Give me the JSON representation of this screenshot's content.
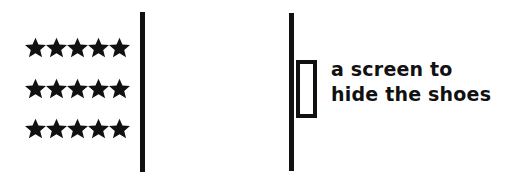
{
  "figure": {
    "background_color": "#ffffff",
    "ink_color": "#111111",
    "left_panel": {
      "name": "shoes-star-grid",
      "icon": "star-icon",
      "rows": 3,
      "columns": 5,
      "total_stars": 15,
      "row_labels": [
        "star-row-1",
        "star-row-2",
        "star-row-3"
      ]
    },
    "barriers": [
      {
        "name": "left-barrier-line",
        "label": ""
      },
      {
        "name": "right-barrier-line",
        "label": ""
      }
    ],
    "screen": {
      "name": "screen-rectangle",
      "label": ""
    },
    "caption": {
      "line1": "a screen to",
      "line2": "hide the shoes"
    }
  }
}
